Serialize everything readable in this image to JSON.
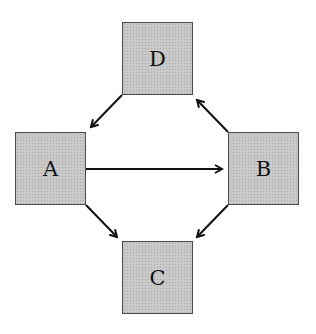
{
  "diagram": {
    "nodes": {
      "D": {
        "label": "D"
      },
      "A": {
        "label": "A"
      },
      "B": {
        "label": "B"
      },
      "C": {
        "label": "C"
      }
    },
    "edges": [
      {
        "from": "D",
        "to": "A"
      },
      {
        "from": "A",
        "to": "B"
      },
      {
        "from": "B",
        "to": "D"
      },
      {
        "from": "A",
        "to": "C"
      },
      {
        "from": "B",
        "to": "C"
      }
    ],
    "colors": {
      "node_fill": "#c9c9c9",
      "edge": "#111111"
    }
  }
}
